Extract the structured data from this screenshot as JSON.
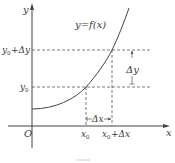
{
  "diagram": {
    "type": "function-increment-graph",
    "function_label": "y=f(x)",
    "axes": {
      "x_label": "x",
      "y_label": "y",
      "origin_label": "O"
    },
    "x_ticks": {
      "x0": "x",
      "x0_sub": "0",
      "x0_plus": "x",
      "x0_plus_sub": "0",
      "x0_plus_rest": "+Δx"
    },
    "y_ticks": {
      "y0": "y",
      "y0_sub": "0",
      "y0_plus": "y",
      "y0_plus_sub": "0",
      "y0_plus_rest": "+Δy"
    },
    "increments": {
      "delta_x": "Δx",
      "delta_y": "Δy"
    },
    "colors": {
      "line": "#444444",
      "text": "#3a3a3a",
      "background": "#ffffff"
    }
  }
}
